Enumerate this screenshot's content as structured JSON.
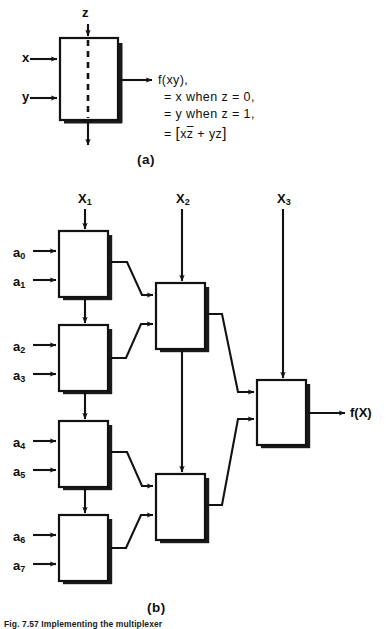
{
  "figure": {
    "parts": [
      {
        "id": "a",
        "label": "(a)"
      },
      {
        "id": "b",
        "label": "(b)"
      }
    ],
    "caption_fragment": "Fig. 7.57  Implementing the multiplexer"
  },
  "part_a": {
    "inputs": [
      {
        "name": "x",
        "label": "x"
      },
      {
        "name": "y",
        "label": "y"
      }
    ],
    "control": {
      "name": "z",
      "label": "z"
    },
    "bottom_out": {
      "name": "z-through",
      "label": ""
    },
    "output_lines": [
      "f(xy),",
      "= x when  z = 0,",
      "= y when  z = 1,"
    ],
    "output_expr_prefix": "=",
    "output_expr": {
      "open": "[",
      "term1_a": "x",
      "term1_b": "z",
      "operator": "+",
      "term2": "yz",
      "close": "]"
    }
  },
  "part_b": {
    "select_inputs": [
      {
        "name": "X1",
        "base": "X",
        "sub": "1"
      },
      {
        "name": "X2",
        "base": "X",
        "sub": "2"
      },
      {
        "name": "X3",
        "base": "X",
        "sub": "3"
      }
    ],
    "data_inputs": [
      {
        "name": "a0",
        "base": "a",
        "sub": "0"
      },
      {
        "name": "a1",
        "base": "a",
        "sub": "1"
      },
      {
        "name": "a2",
        "base": "a",
        "sub": "2"
      },
      {
        "name": "a3",
        "base": "a",
        "sub": "3"
      },
      {
        "name": "a4",
        "base": "a",
        "sub": "4"
      },
      {
        "name": "a5",
        "base": "a",
        "sub": "5"
      },
      {
        "name": "a6",
        "base": "a",
        "sub": "6"
      },
      {
        "name": "a7",
        "base": "a",
        "sub": "7"
      }
    ],
    "output": {
      "name": "f(X)",
      "label": "f(X)"
    },
    "stage1_mux_count": 4,
    "stage2_mux_count": 2,
    "stage3_mux_count": 1
  },
  "colors": {
    "line": "#121212",
    "background": "#ffffff",
    "shadow": "#1a1a1a"
  }
}
